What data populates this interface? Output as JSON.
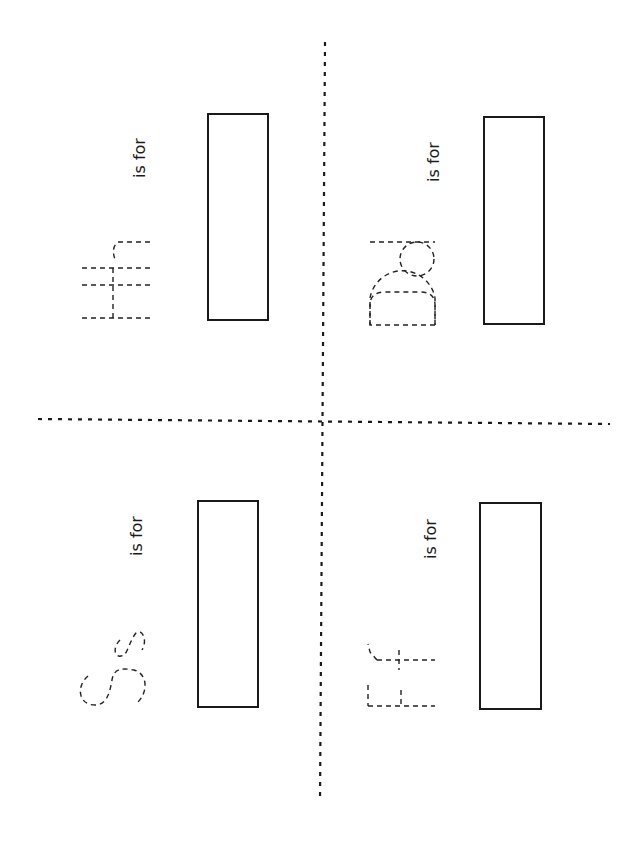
{
  "worksheet": {
    "orientation": "rotated-90-ccw",
    "line_color": "#1a1a1a",
    "cards": [
      {
        "letter_pair": "Hh",
        "label": "is for",
        "position": "top-left"
      },
      {
        "letter_pair": "Dd",
        "label": "is for",
        "position": "top-right"
      },
      {
        "letter_pair": "Ss",
        "label": "is for",
        "position": "bottom-left"
      },
      {
        "letter_pair": "Ff",
        "label": "is for",
        "position": "bottom-right"
      }
    ]
  }
}
